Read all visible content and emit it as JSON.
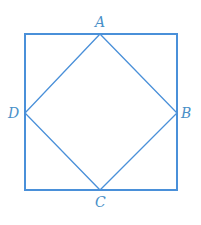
{
  "diagram": {
    "type": "square-inscribed-rhombus",
    "stroke_color": "#4a90d9",
    "outer_square": {
      "x": 25,
      "y": 34,
      "width": 152,
      "height": 156
    },
    "vertices": [
      {
        "name": "A",
        "x": 100,
        "y": 34
      },
      {
        "name": "B",
        "x": 177,
        "y": 113
      },
      {
        "name": "C",
        "x": 100,
        "y": 190
      },
      {
        "name": "D",
        "x": 25,
        "y": 113
      }
    ],
    "labels": {
      "A": "A",
      "B": "B",
      "C": "C",
      "D": "D"
    }
  }
}
